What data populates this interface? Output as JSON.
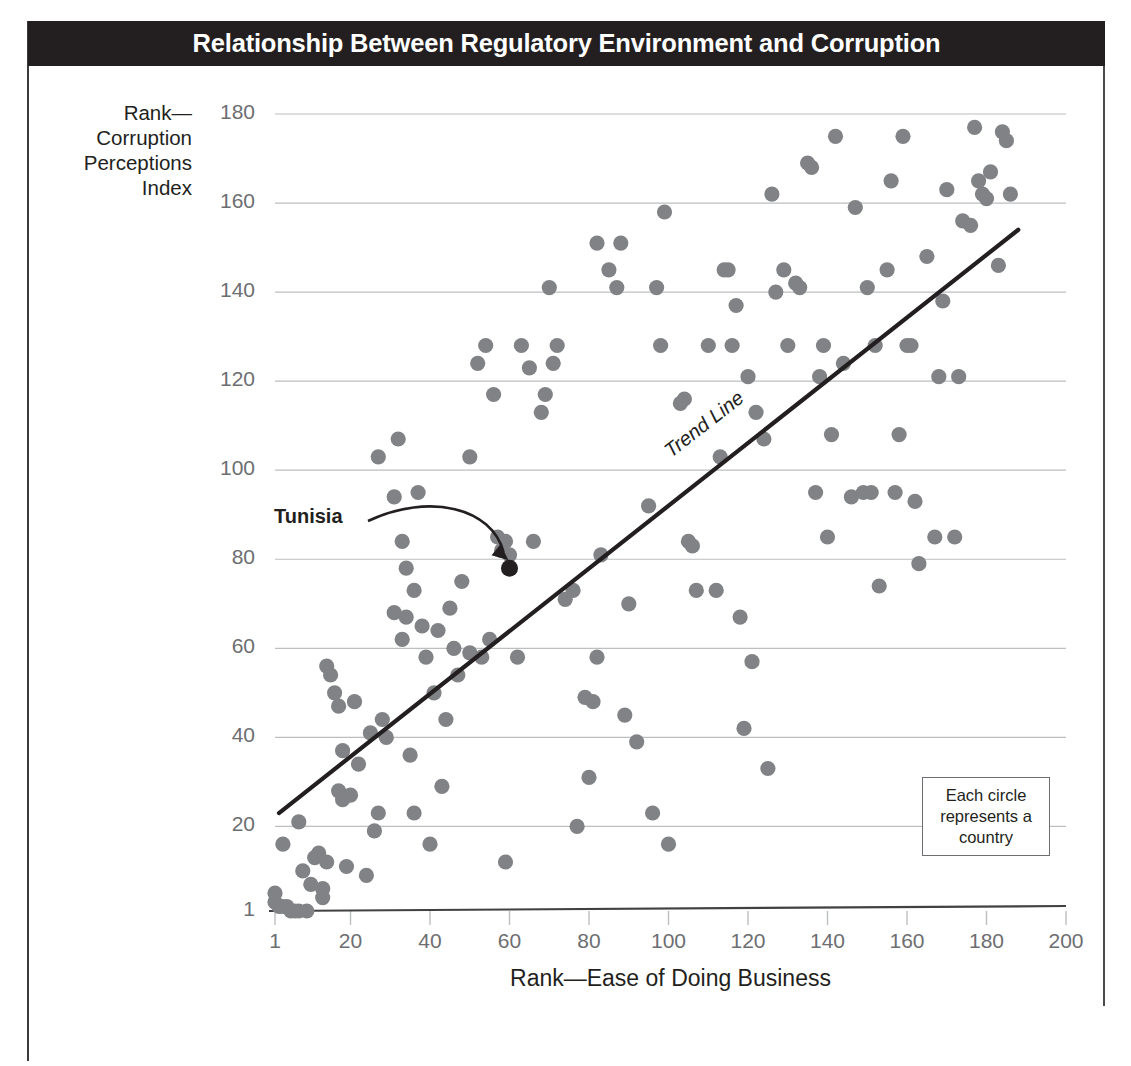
{
  "title": "Relationship Between Regulatory Environment and Corruption",
  "ylabel_lines": [
    "Rank—",
    "Corruption",
    "Perceptions",
    "Index"
  ],
  "legend": {
    "lines": [
      "Each circle",
      "represents a",
      "country"
    ]
  },
  "annotations": {
    "tunisia_label": "Tunisia",
    "trend_label": "Trend Line"
  },
  "colors": {
    "title_bar": "#231f20",
    "title_text": "#ffffff",
    "dot": "#808285",
    "highlight_dot": "#231f20",
    "grid": "#bcbec0",
    "axis": "#414042",
    "tick_text": "#6d6e71"
  },
  "chart_data": {
    "type": "scatter",
    "title": "Relationship Between Regulatory Environment and Corruption",
    "xlabel": "Rank—Ease of Doing Business",
    "ylabel": "Rank—Corruption Perceptions Index",
    "xlim": [
      1,
      200
    ],
    "ylim": [
      1,
      180
    ],
    "xticks": [
      1,
      20,
      40,
      60,
      80,
      100,
      120,
      140,
      160,
      180,
      200
    ],
    "yticks": [
      1,
      20,
      40,
      60,
      80,
      100,
      120,
      140,
      160,
      180
    ],
    "grid": "horizontal",
    "legend_position": "bottom-right",
    "series": [
      {
        "name": "Countries",
        "marker": "circle",
        "color": "#808285",
        "points": [
          [
            1,
            5
          ],
          [
            1,
            3
          ],
          [
            2,
            2
          ],
          [
            3,
            16
          ],
          [
            3,
            2
          ],
          [
            4,
            2
          ],
          [
            5,
            1
          ],
          [
            6,
            1
          ],
          [
            7,
            21
          ],
          [
            7,
            1
          ],
          [
            8,
            10
          ],
          [
            9,
            1
          ],
          [
            10,
            7
          ],
          [
            11,
            13
          ],
          [
            12,
            14
          ],
          [
            13,
            6
          ],
          [
            13,
            4
          ],
          [
            14,
            12
          ],
          [
            14,
            56
          ],
          [
            15,
            54
          ],
          [
            16,
            50
          ],
          [
            17,
            28
          ],
          [
            17,
            47
          ],
          [
            18,
            37
          ],
          [
            18,
            26
          ],
          [
            19,
            11
          ],
          [
            20,
            27
          ],
          [
            21,
            48
          ],
          [
            22,
            34
          ],
          [
            24,
            9
          ],
          [
            25,
            41
          ],
          [
            26,
            19
          ],
          [
            27,
            103
          ],
          [
            27,
            23
          ],
          [
            28,
            44
          ],
          [
            29,
            40
          ],
          [
            31,
            94
          ],
          [
            31,
            68
          ],
          [
            32,
            107
          ],
          [
            33,
            84
          ],
          [
            33,
            62
          ],
          [
            34,
            78
          ],
          [
            34,
            67
          ],
          [
            35,
            36
          ],
          [
            36,
            73
          ],
          [
            36,
            23
          ],
          [
            37,
            95
          ],
          [
            38,
            65
          ],
          [
            39,
            58
          ],
          [
            40,
            16
          ],
          [
            41,
            50
          ],
          [
            42,
            64
          ],
          [
            43,
            29
          ],
          [
            44,
            44
          ],
          [
            45,
            69
          ],
          [
            46,
            60
          ],
          [
            47,
            54
          ],
          [
            48,
            75
          ],
          [
            50,
            103
          ],
          [
            50,
            59
          ],
          [
            52,
            124
          ],
          [
            53,
            58
          ],
          [
            54,
            128
          ],
          [
            55,
            62
          ],
          [
            56,
            117
          ],
          [
            57,
            85
          ],
          [
            58,
            82
          ],
          [
            59,
            84
          ],
          [
            59,
            12
          ],
          [
            60,
            81
          ],
          [
            62,
            58
          ],
          [
            63,
            128
          ],
          [
            65,
            123
          ],
          [
            66,
            84
          ],
          [
            68,
            113
          ],
          [
            69,
            117
          ],
          [
            70,
            141
          ],
          [
            71,
            124
          ],
          [
            72,
            128
          ],
          [
            74,
            71
          ],
          [
            76,
            73
          ],
          [
            77,
            20
          ],
          [
            79,
            49
          ],
          [
            80,
            31
          ],
          [
            81,
            48
          ],
          [
            82,
            151
          ],
          [
            82,
            58
          ],
          [
            83,
            81
          ],
          [
            85,
            145
          ],
          [
            87,
            141
          ],
          [
            88,
            151
          ],
          [
            89,
            45
          ],
          [
            90,
            70
          ],
          [
            92,
            39
          ],
          [
            95,
            92
          ],
          [
            96,
            23
          ],
          [
            97,
            141
          ],
          [
            98,
            128
          ],
          [
            99,
            158
          ],
          [
            100,
            16
          ],
          [
            103,
            115
          ],
          [
            104,
            116
          ],
          [
            105,
            84
          ],
          [
            106,
            83
          ],
          [
            107,
            73
          ],
          [
            110,
            128
          ],
          [
            112,
            73
          ],
          [
            113,
            103
          ],
          [
            114,
            145
          ],
          [
            115,
            145
          ],
          [
            116,
            128
          ],
          [
            117,
            137
          ],
          [
            118,
            67
          ],
          [
            119,
            42
          ],
          [
            120,
            121
          ],
          [
            121,
            57
          ],
          [
            122,
            113
          ],
          [
            124,
            107
          ],
          [
            125,
            33
          ],
          [
            126,
            162
          ],
          [
            127,
            140
          ],
          [
            129,
            145
          ],
          [
            130,
            128
          ],
          [
            132,
            142
          ],
          [
            133,
            141
          ],
          [
            135,
            169
          ],
          [
            136,
            168
          ],
          [
            137,
            95
          ],
          [
            138,
            121
          ],
          [
            139,
            128
          ],
          [
            140,
            85
          ],
          [
            141,
            108
          ],
          [
            142,
            175
          ],
          [
            144,
            124
          ],
          [
            146,
            94
          ],
          [
            147,
            159
          ],
          [
            149,
            95
          ],
          [
            150,
            141
          ],
          [
            151,
            95
          ],
          [
            152,
            128
          ],
          [
            153,
            74
          ],
          [
            155,
            145
          ],
          [
            156,
            165
          ],
          [
            157,
            95
          ],
          [
            158,
            108
          ],
          [
            159,
            175
          ],
          [
            160,
            128
          ],
          [
            161,
            128
          ],
          [
            162,
            93
          ],
          [
            163,
            79
          ],
          [
            165,
            148
          ],
          [
            167,
            85
          ],
          [
            168,
            121
          ],
          [
            169,
            138
          ],
          [
            170,
            163
          ],
          [
            172,
            85
          ],
          [
            173,
            121
          ],
          [
            174,
            156
          ],
          [
            176,
            155
          ],
          [
            177,
            177
          ],
          [
            178,
            165
          ],
          [
            179,
            162
          ],
          [
            180,
            161
          ],
          [
            181,
            167
          ],
          [
            183,
            146
          ],
          [
            184,
            176
          ],
          [
            185,
            174
          ],
          [
            186,
            162
          ]
        ]
      },
      {
        "name": "Tunisia",
        "marker": "circle",
        "color": "#231f20",
        "points": [
          [
            60,
            78
          ]
        ]
      }
    ],
    "trend_line": {
      "label": "Trend Line",
      "start": [
        2,
        23
      ],
      "end": [
        188,
        154
      ]
    },
    "annotations": [
      {
        "text": "Tunisia",
        "target": [
          60,
          78
        ]
      },
      {
        "text": "Each circle represents a country"
      }
    ]
  }
}
